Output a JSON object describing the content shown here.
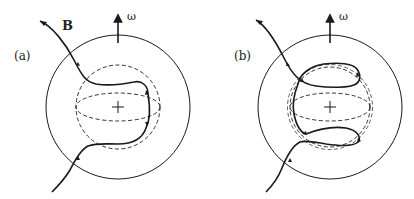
{
  "figure": {
    "panels": [
      {
        "id": "a",
        "label": "(a)",
        "field_label": "B",
        "rotation_label": "ω",
        "description": "Field line threads the star, passing around the dashed inner sphere"
      },
      {
        "id": "b",
        "label": "(b)",
        "rotation_label": "ω",
        "description": "Field line loops wrap around the inner sphere in northern and southern hemispheres"
      }
    ],
    "colors": {
      "line": "#1a1a1a",
      "background": "#ffffff"
    }
  }
}
